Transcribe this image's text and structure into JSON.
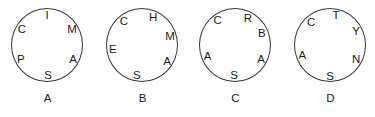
{
  "figure": {
    "background_color": "#ffffff",
    "stroke_color": "#3a3a3a",
    "text_color": "#1b1b1b",
    "wheel_count": 4
  },
  "chart_data": {
    "type": "diagram",
    "title": "",
    "subtitle": "",
    "xlabel": "",
    "ylabel": "",
    "legend_position": "none",
    "grid": false,
    "wheels": [
      {
        "label": "A",
        "letters": [
          "I",
          "M",
          "A",
          "S",
          "P",
          "C"
        ],
        "letters_clockwise_from_top": "I, M, A, S, P, C",
        "positions": [
          {
            "letter": "I",
            "angle_deg": 0
          },
          {
            "letter": "M",
            "angle_deg": 58
          },
          {
            "letter": "A",
            "angle_deg": 118
          },
          {
            "letter": "S",
            "angle_deg": 178
          },
          {
            "letter": "P",
            "angle_deg": 242
          },
          {
            "letter": "C",
            "angle_deg": 302
          }
        ]
      },
      {
        "label": "B",
        "letters": [
          "H",
          "M",
          "A",
          "S",
          "E",
          "C"
        ],
        "letters_clockwise_from_top": "H, M, A, S, E, C",
        "positions": [
          {
            "letter": "H",
            "angle_deg": 22
          },
          {
            "letter": "M",
            "angle_deg": 72
          },
          {
            "letter": "A",
            "angle_deg": 122
          },
          {
            "letter": "S",
            "angle_deg": 190
          },
          {
            "letter": "E",
            "angle_deg": 262
          },
          {
            "letter": "C",
            "angle_deg": 322
          }
        ]
      },
      {
        "label": "C",
        "letters": [
          "R",
          "B",
          "A",
          "S",
          "A",
          "C"
        ],
        "letters_clockwise_from_top": "R, B, A, S, A, C",
        "positions": [
          {
            "letter": "R",
            "angle_deg": 26
          },
          {
            "letter": "B",
            "angle_deg": 66
          },
          {
            "letter": "A",
            "angle_deg": 118
          },
          {
            "letter": "S",
            "angle_deg": 182
          },
          {
            "letter": "A",
            "angle_deg": 248
          },
          {
            "letter": "C",
            "angle_deg": 324
          }
        ]
      },
      {
        "label": "D",
        "letters": [
          "T",
          "Y",
          "N",
          "S",
          "A",
          "C"
        ],
        "letters_clockwise_from_top": "T, Y, N, S, A, C",
        "positions": [
          {
            "letter": "T",
            "angle_deg": 12
          },
          {
            "letter": "Y",
            "angle_deg": 62
          },
          {
            "letter": "N",
            "angle_deg": 118
          },
          {
            "letter": "S",
            "angle_deg": 180
          },
          {
            "letter": "A",
            "angle_deg": 250
          },
          {
            "letter": "C",
            "angle_deg": 320
          }
        ]
      }
    ]
  }
}
